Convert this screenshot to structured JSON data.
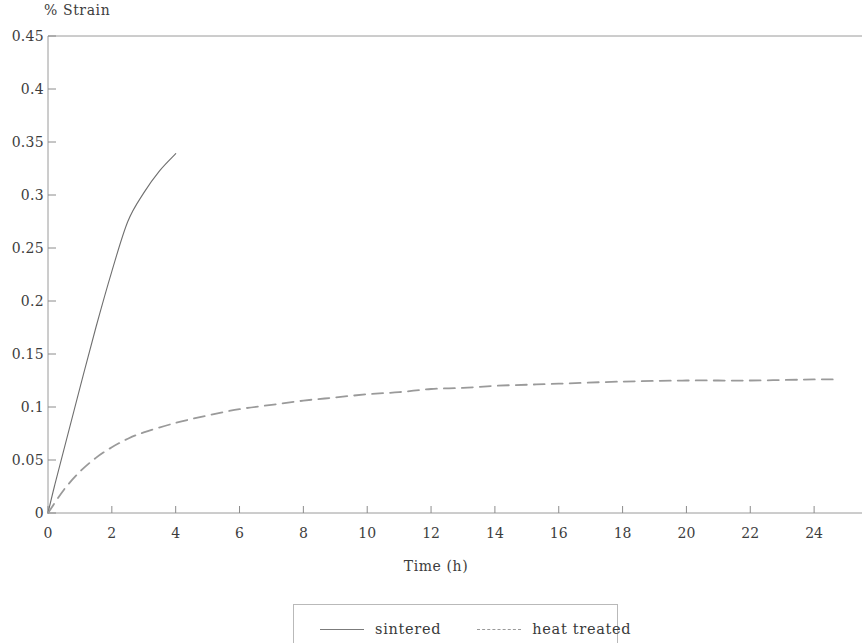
{
  "chart_data": {
    "type": "line",
    "title": "",
    "xlabel": "Time (h)",
    "ylabel": "% Strain",
    "xlim": [
      0,
      25.5
    ],
    "ylim": [
      0,
      0.45
    ],
    "grid": false,
    "legend_position": "bottom",
    "xticks": [
      "0",
      "2",
      "4",
      "6",
      "8",
      "10",
      "12",
      "14",
      "16",
      "18",
      "20",
      "22",
      "24"
    ],
    "xtick_values": [
      0,
      2,
      4,
      6,
      8,
      10,
      12,
      14,
      16,
      18,
      20,
      22,
      24
    ],
    "yticks": [
      "0",
      "0.05",
      "0.1",
      "0.15",
      "0.2",
      "0.25",
      "0.3",
      "0.35",
      "0.4",
      "0.45"
    ],
    "ytick_values": [
      0,
      0.05,
      0.1,
      0.15,
      0.2,
      0.25,
      0.3,
      0.35,
      0.4,
      0.45
    ],
    "series": [
      {
        "name": "sintered",
        "style": "solid",
        "color": "#6f6f6f",
        "x": [
          0,
          0.2,
          0.5,
          1.0,
          1.5,
          2.0,
          2.5,
          3.0,
          3.5,
          4.0
        ],
        "values": [
          0,
          0.025,
          0.06,
          0.118,
          0.175,
          0.228,
          0.275,
          0.302,
          0.323,
          0.339
        ]
      },
      {
        "name": "heat treated",
        "style": "dashed",
        "color": "#9a9a9a",
        "x": [
          0,
          0.5,
          1.0,
          1.5,
          2.0,
          2.5,
          3.0,
          4.0,
          5.0,
          6.0,
          7.0,
          8.0,
          9.0,
          10.0,
          11.0,
          12.0,
          13.0,
          14.0,
          15.0,
          16.0,
          18.0,
          20.0,
          22.0,
          24.0,
          24.6
        ],
        "values": [
          0,
          0.022,
          0.039,
          0.052,
          0.062,
          0.07,
          0.076,
          0.085,
          0.092,
          0.098,
          0.102,
          0.106,
          0.109,
          0.112,
          0.114,
          0.117,
          0.118,
          0.12,
          0.121,
          0.122,
          0.124,
          0.125,
          0.125,
          0.126,
          0.126
        ]
      }
    ]
  },
  "axes": {
    "ylabel_top": "% Strain",
    "xlabel": "Time (h)"
  },
  "legend": {
    "items": [
      {
        "label": "sintered",
        "style": "solid"
      },
      {
        "label": "heat treated",
        "style": "dashed"
      }
    ]
  },
  "colors": {
    "axis": "#8c8c8c",
    "sintered": "#6f6f6f",
    "heat_treated": "#9a9a9a",
    "text": "#3a3a3a",
    "background": "#ffffff"
  }
}
